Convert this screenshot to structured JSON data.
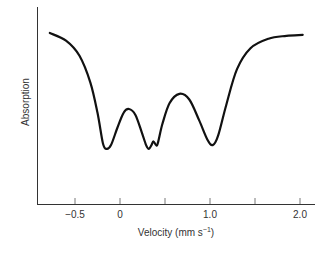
{
  "chart_data": {
    "type": "line",
    "title": "",
    "xlabel": "Velocity (mm s⁻¹)",
    "xlabel_main": "Velocity (mm s",
    "xlabel_sup": "−1",
    "xlabel_close": ")",
    "ylabel": "Absorption",
    "xlim": [
      -0.95,
      2.2
    ],
    "x_ticks": [
      -0.5,
      0,
      0.5,
      1.0,
      1.5,
      2.0
    ],
    "x_tick_labels": [
      "−0.5",
      "0",
      "",
      "1.0",
      "",
      "2.0"
    ],
    "y_ticks": [],
    "grid": false,
    "legend": null,
    "series": [
      {
        "name": "Mössbauer spectrum",
        "color": "#111111",
        "points": [
          {
            "x": -0.78,
            "y": 0.9
          },
          {
            "x": -0.6,
            "y": 0.86
          },
          {
            "x": -0.45,
            "y": 0.78
          },
          {
            "x": -0.33,
            "y": 0.64
          },
          {
            "x": -0.25,
            "y": 0.48
          },
          {
            "x": -0.19,
            "y": 0.32
          },
          {
            "x": -0.15,
            "y": 0.29
          },
          {
            "x": -0.1,
            "y": 0.31
          },
          {
            "x": -0.03,
            "y": 0.4
          },
          {
            "x": 0.04,
            "y": 0.48
          },
          {
            "x": 0.1,
            "y": 0.5
          },
          {
            "x": 0.17,
            "y": 0.47
          },
          {
            "x": 0.24,
            "y": 0.38
          },
          {
            "x": 0.29,
            "y": 0.31
          },
          {
            "x": 0.32,
            "y": 0.29
          },
          {
            "x": 0.35,
            "y": 0.31
          },
          {
            "x": 0.37,
            "y": 0.33
          },
          {
            "x": 0.4,
            "y": 0.31
          },
          {
            "x": 0.42,
            "y": 0.32
          },
          {
            "x": 0.47,
            "y": 0.42
          },
          {
            "x": 0.55,
            "y": 0.53
          },
          {
            "x": 0.66,
            "y": 0.58
          },
          {
            "x": 0.77,
            "y": 0.55
          },
          {
            "x": 0.88,
            "y": 0.44
          },
          {
            "x": 0.97,
            "y": 0.34
          },
          {
            "x": 1.03,
            "y": 0.31
          },
          {
            "x": 1.09,
            "y": 0.36
          },
          {
            "x": 1.18,
            "y": 0.52
          },
          {
            "x": 1.3,
            "y": 0.71
          },
          {
            "x": 1.45,
            "y": 0.82
          },
          {
            "x": 1.65,
            "y": 0.87
          },
          {
            "x": 1.85,
            "y": 0.885
          },
          {
            "x": 2.03,
            "y": 0.89
          }
        ]
      }
    ],
    "annotations": []
  }
}
